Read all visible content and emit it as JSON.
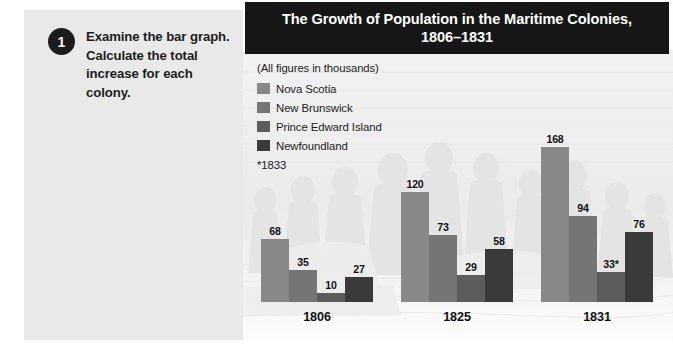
{
  "task": {
    "number": "1",
    "instruction": "Examine the bar graph. Calculate the total increase for each colony."
  },
  "chart_panel": {
    "title_line1": "The Growth of Population in the Maritime Colonies,",
    "title_line2": "1806–1831",
    "units_note": "(All figures in thousands)",
    "footnote": "*1833",
    "background_art": "historical-engraving-of-settlers"
  },
  "colors": {
    "panel_background": "#e9e9e9",
    "title_bar": "#161616",
    "badge": "#1c1c1c",
    "series_nova_scotia": "#888888",
    "series_new_brunswick": "#757575",
    "series_prince_edward_island": "#5c5c5c",
    "series_newfoundland": "#3a3a3a"
  },
  "chart_data": {
    "type": "bar",
    "title": "The Growth of Population in the Maritime Colonies, 1806–1831",
    "xlabel": "",
    "ylabel": "Population (thousands)",
    "ylim": [
      0,
      175
    ],
    "grid": false,
    "legend_position": "top-left",
    "units": "thousands",
    "categories": [
      "1806",
      "1825",
      "1831"
    ],
    "series": [
      {
        "name": "Nova Scotia",
        "color": "#888888",
        "values": [
          68,
          120,
          168
        ],
        "labels": [
          "68",
          "120",
          "168"
        ]
      },
      {
        "name": "New Brunswick",
        "color": "#757575",
        "values": [
          35,
          73,
          94
        ],
        "labels": [
          "35",
          "73",
          "94"
        ]
      },
      {
        "name": "Prince Edward Island",
        "color": "#5c5c5c",
        "values": [
          10,
          29,
          33
        ],
        "labels": [
          "10",
          "29",
          "33*"
        ]
      },
      {
        "name": "Newfoundland",
        "color": "#3a3a3a",
        "values": [
          27,
          58,
          76
        ],
        "labels": [
          "27",
          "58",
          "76"
        ]
      }
    ],
    "annotations": [
      "*1833"
    ]
  }
}
